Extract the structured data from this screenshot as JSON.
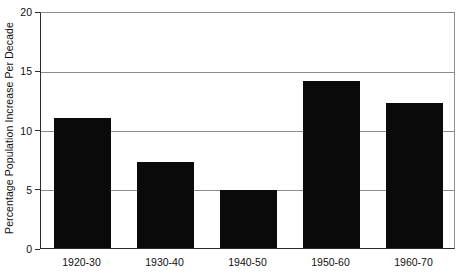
{
  "chart_data": {
    "type": "bar",
    "title": "",
    "xlabel": "",
    "ylabel": "Percentage Population Increase Per Decade",
    "categories": [
      "1920-30",
      "1930-40",
      "1940-50",
      "1950-60",
      "1960-70"
    ],
    "values": [
      11.0,
      7.3,
      4.9,
      14.1,
      12.2
    ],
    "ylim": [
      0,
      20
    ],
    "yticks": [
      0,
      5,
      10,
      15,
      20
    ],
    "ytick_labels": [
      "0",
      "5",
      "10",
      "15",
      "20"
    ],
    "grid": true,
    "legend": null,
    "bar_color": "#0a0a0a",
    "axis_color": "#2b2b2b",
    "grid_color": "#8c8c8c",
    "background_color": "#ffffff"
  }
}
